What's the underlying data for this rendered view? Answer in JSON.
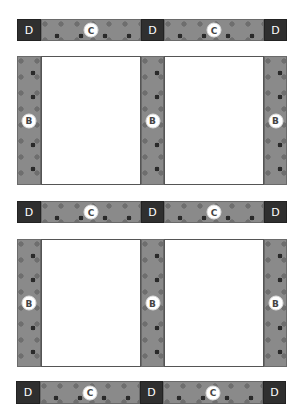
{
  "diagram": {
    "type": "layout",
    "labels": {
      "cornerstone": "D",
      "horizontal_sash": "C",
      "vertical_sash": "B"
    },
    "colors": {
      "strip": "#8a8a8a",
      "dot_dark": "#2a2a2a",
      "dot_mid": "#6e6e6e",
      "cornerstone": "#2f2f2f",
      "panel": "#ffffff"
    },
    "rows": {
      "sash_rows": 3,
      "panel_rows": 2,
      "panels_per_row": 2
    }
  }
}
